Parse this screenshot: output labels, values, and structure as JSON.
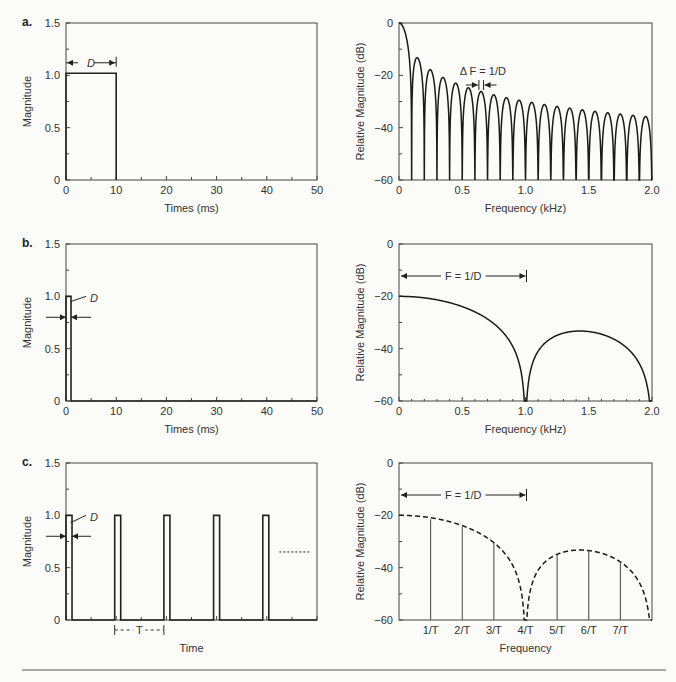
{
  "panels": [
    {
      "label": "a.",
      "time_xlabel": "Times (ms)",
      "time_ylabel": "Magnitude",
      "freq_xlabel": "Frequency (kHz)",
      "freq_ylabel": "Relative Magnitude (dB)",
      "annotation_time": "D",
      "annotation_freq": "Δ F = 1/D"
    },
    {
      "label": "b.",
      "time_xlabel": "Times (ms)",
      "time_ylabel": "Magnitude",
      "freq_xlabel": "Frequency (kHz)",
      "freq_ylabel": "Relative Magnitude (dB)",
      "annotation_time": "D",
      "annotation_freq": "F = 1/D"
    },
    {
      "label": "c.",
      "time_xlabel": "Time",
      "time_ylabel": "Magnitude",
      "freq_xlabel": "Frequency",
      "freq_ylabel": "Relative Magnitude (dB)",
      "annotation_time": "D",
      "annotation_period": "T",
      "annotation_freq": "F = 1/D"
    }
  ],
  "ticks": {
    "time_x": [
      "0",
      "10",
      "20",
      "30",
      "40",
      "50"
    ],
    "time_y": [
      "0",
      "0.5",
      "1.0",
      "1.5"
    ],
    "freq_x": [
      "0",
      "0.5",
      "1.0",
      "1.5",
      "2.0"
    ],
    "freq_y": [
      "0",
      "−20",
      "−40",
      "−60"
    ],
    "harmonic_x": [
      "1/T",
      "2/T",
      "3/T",
      "4/T",
      "5/T",
      "6/T",
      "7/T"
    ]
  },
  "chart_data": [
    {
      "type": "line",
      "title": "a. Rectangular pulse, D = 10 ms",
      "xlabel": "Times (ms)",
      "ylabel": "Magnitude",
      "xlim": [
        0,
        50
      ],
      "ylim": [
        0,
        1.5
      ],
      "x": [
        0,
        0,
        10,
        10
      ],
      "y": [
        0,
        1.0,
        1.0,
        0
      ],
      "annotation": "D"
    },
    {
      "type": "line",
      "title": "a. Spectrum (sinc, nulls every 0.1 kHz)",
      "xlabel": "Frequency (kHz)",
      "ylabel": "Relative Magnitude (dB)",
      "xlim": [
        0,
        2.0
      ],
      "ylim": [
        -60,
        0
      ],
      "null_spacing_khz": 0.1,
      "sidelobe_peaks_db": [
        -13.5,
        -18,
        -21,
        -23,
        -25,
        -26.5,
        -28,
        -29,
        -30,
        -30.5,
        -31.5,
        -32,
        -33,
        -33.5,
        -34,
        -34.5,
        -35,
        -35.5,
        -36
      ],
      "annotation": "Δ F = 1/D"
    },
    {
      "type": "line",
      "title": "b. Rectangular pulse, D = 1 ms",
      "xlabel": "Times (ms)",
      "ylabel": "Magnitude",
      "xlim": [
        0,
        50
      ],
      "ylim": [
        0,
        1.5
      ],
      "x": [
        0,
        0,
        1,
        1
      ],
      "y": [
        0,
        1.0,
        1.0,
        0
      ],
      "annotation": "D"
    },
    {
      "type": "line",
      "title": "b. Spectrum (null at 1.0 kHz)",
      "xlabel": "Frequency (kHz)",
      "ylabel": "Relative Magnitude (dB)",
      "xlim": [
        0,
        2.0
      ],
      "ylim": [
        -60,
        0
      ],
      "main_lobe_start_db": -20,
      "null_khz": [
        1.0,
        2.0
      ],
      "sidelobe_peak": {
        "x": 1.43,
        "y": -33.5
      },
      "annotation": "F = 1/D"
    },
    {
      "type": "line",
      "title": "c. Periodic pulse train, period T",
      "xlabel": "Time",
      "ylabel": "Magnitude",
      "ylim": [
        0,
        1.5
      ],
      "pulse_height": 1.0,
      "pulses": 5,
      "annotation": [
        "D",
        "T"
      ]
    },
    {
      "type": "bar",
      "title": "c. Line spectrum at harmonics of 1/T",
      "xlabel": "Frequency",
      "ylabel": "Relative Magnitude (dB)",
      "ylim": [
        -60,
        0
      ],
      "categories": [
        "1/T",
        "2/T",
        "3/T",
        "4/T",
        "5/T",
        "6/T",
        "7/T"
      ],
      "values": [
        -21.5,
        -24.5,
        -30.5,
        -60,
        -35,
        -33.5,
        -37.5
      ],
      "envelope": "dashed sinc",
      "annotation": "F = 1/D"
    }
  ]
}
